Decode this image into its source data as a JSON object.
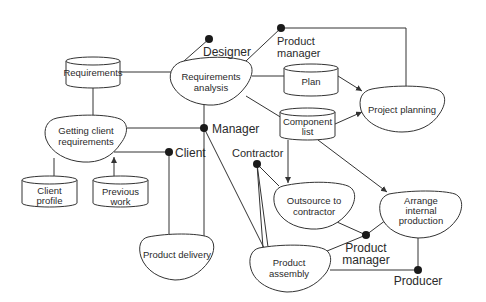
{
  "diagram": {
    "type": "process-role-data-flow",
    "processes": [
      {
        "id": "req-analysis",
        "label_lines": [
          "Requirements",
          "analysis"
        ]
      },
      {
        "id": "project-planning",
        "label_lines": [
          "Project planning"
        ]
      },
      {
        "id": "getting-client-req",
        "label_lines": [
          "Getting client",
          "requirements"
        ]
      },
      {
        "id": "outsource",
        "label_lines": [
          "Outsource to",
          "contractor"
        ]
      },
      {
        "id": "arrange-internal",
        "label_lines": [
          "Arrange",
          "internal",
          "production"
        ]
      },
      {
        "id": "product-delivery",
        "label_lines": [
          "Product delivery"
        ]
      },
      {
        "id": "product-assembly",
        "label_lines": [
          "Product",
          "assembly"
        ]
      }
    ],
    "data_stores": [
      {
        "id": "requirements",
        "label_lines": [
          "Requirements"
        ]
      },
      {
        "id": "plan",
        "label_lines": [
          "Plan"
        ]
      },
      {
        "id": "component-list",
        "label_lines": [
          "Component",
          "list"
        ]
      },
      {
        "id": "client-profile",
        "label_lines": [
          "Client",
          "profile"
        ]
      },
      {
        "id": "previous-work",
        "label_lines": [
          "Previous",
          "work"
        ]
      }
    ],
    "roles": [
      {
        "id": "designer",
        "label_lines": [
          "Designer"
        ]
      },
      {
        "id": "product-manager-top",
        "label_lines": [
          "Product",
          "manager"
        ]
      },
      {
        "id": "manager",
        "label_lines": [
          "Manager"
        ]
      },
      {
        "id": "client",
        "label_lines": [
          "Client"
        ]
      },
      {
        "id": "contractor",
        "label_lines": [
          "Contractor"
        ]
      },
      {
        "id": "product-manager-bottom",
        "label_lines": [
          "Product",
          "manager"
        ]
      },
      {
        "id": "producer",
        "label_lines": [
          "Producer"
        ]
      }
    ],
    "connections": [
      {
        "from": "requirements",
        "to": "req-analysis"
      },
      {
        "from": "requirements",
        "to": "getting-client-req"
      },
      {
        "from": "designer",
        "to": "req-analysis"
      },
      {
        "from": "product-manager-top",
        "to": "req-analysis"
      },
      {
        "from": "product-manager-top",
        "to": "project-planning"
      },
      {
        "from": "req-analysis",
        "to": "plan"
      },
      {
        "from": "req-analysis",
        "to": "component-list"
      },
      {
        "from": "plan",
        "to": "project-planning",
        "arrow": true
      },
      {
        "from": "component-list",
        "to": "project-planning",
        "arrow": true
      },
      {
        "from": "component-list",
        "to": "outsource",
        "arrow": true
      },
      {
        "from": "component-list",
        "to": "arrange-internal",
        "arrow": true
      },
      {
        "from": "manager",
        "to": "req-analysis"
      },
      {
        "from": "manager",
        "to": "getting-client-req"
      },
      {
        "from": "manager",
        "to": "product-delivery"
      },
      {
        "from": "manager",
        "to": "product-assembly"
      },
      {
        "from": "client",
        "to": "getting-client-req"
      },
      {
        "from": "client",
        "to": "product-delivery"
      },
      {
        "from": "client-profile",
        "to": "getting-client-req"
      },
      {
        "from": "previous-work",
        "to": "getting-client-req",
        "arrow": true
      },
      {
        "from": "contractor",
        "to": "outsource"
      },
      {
        "from": "contractor",
        "to": "product-assembly"
      },
      {
        "from": "product-manager-bottom",
        "to": "outsource"
      },
      {
        "from": "product-manager-bottom",
        "to": "arrange-internal"
      },
      {
        "from": "product-manager-bottom",
        "to": "product-assembly"
      },
      {
        "from": "producer",
        "to": "arrange-internal"
      },
      {
        "from": "producer",
        "to": "product-assembly"
      }
    ]
  }
}
